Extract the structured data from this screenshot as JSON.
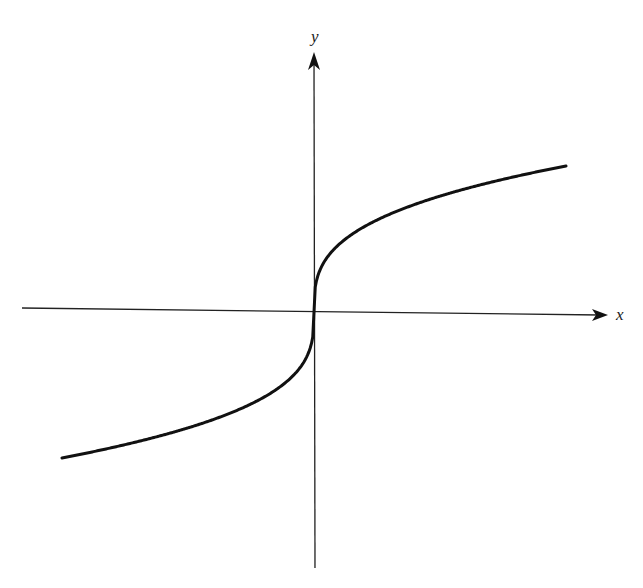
{
  "chart_data": {
    "type": "line",
    "title": "",
    "xlabel": "x",
    "ylabel": "y",
    "function": "y = x^(1/3)",
    "grid": false,
    "legend": null,
    "ticks": {
      "x": [],
      "y": []
    },
    "xlim": [
      -8,
      8
    ],
    "ylim": [
      -2.2,
      2.2
    ],
    "series": [
      {
        "name": "y = x^(1/3)",
        "color": "#111111",
        "x": [
          -8,
          -6,
          -4,
          -2,
          -1,
          -0.5,
          -0.1,
          0,
          0.1,
          0.5,
          1,
          2,
          4,
          6,
          8
        ],
        "y": [
          -2.0,
          -1.817,
          -1.587,
          -1.26,
          -1.0,
          -0.794,
          -0.464,
          0,
          0.464,
          0.794,
          1.0,
          1.26,
          1.587,
          1.817,
          2.0
        ]
      }
    ],
    "axes": {
      "x_axis": {
        "label": "x",
        "arrow": "right",
        "color": "#222222"
      },
      "y_axis": {
        "label": "y",
        "arrow": "up",
        "color": "#222222"
      }
    }
  },
  "labels": {
    "x_axis": "x",
    "y_axis": "y"
  },
  "colors": {
    "background": "#ffffff",
    "axis": "#222222",
    "curve": "#111111"
  }
}
